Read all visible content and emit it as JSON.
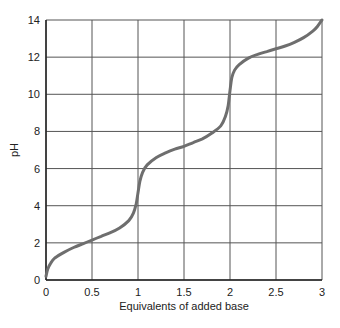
{
  "chart_data": {
    "type": "line",
    "title": "",
    "xlabel": "Equivalents of added base",
    "ylabel": "pH",
    "xlim": [
      0,
      3
    ],
    "ylim": [
      0,
      14
    ],
    "xticks": [
      "0",
      "0.5",
      "1",
      "1.5",
      "2",
      "2.5",
      "3"
    ],
    "yticks": [
      "0",
      "2",
      "4",
      "6",
      "8",
      "10",
      "12",
      "14"
    ],
    "grid": true,
    "series": [
      {
        "name": "titration curve",
        "color": "#6e6e6e",
        "x": [
          0,
          0.02,
          0.05,
          0.1,
          0.2,
          0.3,
          0.4,
          0.5,
          0.6,
          0.7,
          0.8,
          0.9,
          0.95,
          0.98,
          1.0,
          1.02,
          1.05,
          1.1,
          1.2,
          1.3,
          1.4,
          1.5,
          1.6,
          1.7,
          1.8,
          1.9,
          1.95,
          1.98,
          2.0,
          2.02,
          2.05,
          2.1,
          2.2,
          2.3,
          2.4,
          2.5,
          2.6,
          2.7,
          2.8,
          2.9,
          2.95,
          3.0
        ],
        "y": [
          0.2,
          0.6,
          0.9,
          1.2,
          1.5,
          1.75,
          1.95,
          2.15,
          2.35,
          2.55,
          2.8,
          3.2,
          3.6,
          4.1,
          4.7,
          5.3,
          5.8,
          6.2,
          6.6,
          6.85,
          7.05,
          7.2,
          7.4,
          7.6,
          7.9,
          8.3,
          8.8,
          9.4,
          10.2,
          10.9,
          11.3,
          11.6,
          11.95,
          12.15,
          12.3,
          12.45,
          12.6,
          12.8,
          13.05,
          13.4,
          13.65,
          14.0
        ]
      }
    ]
  }
}
